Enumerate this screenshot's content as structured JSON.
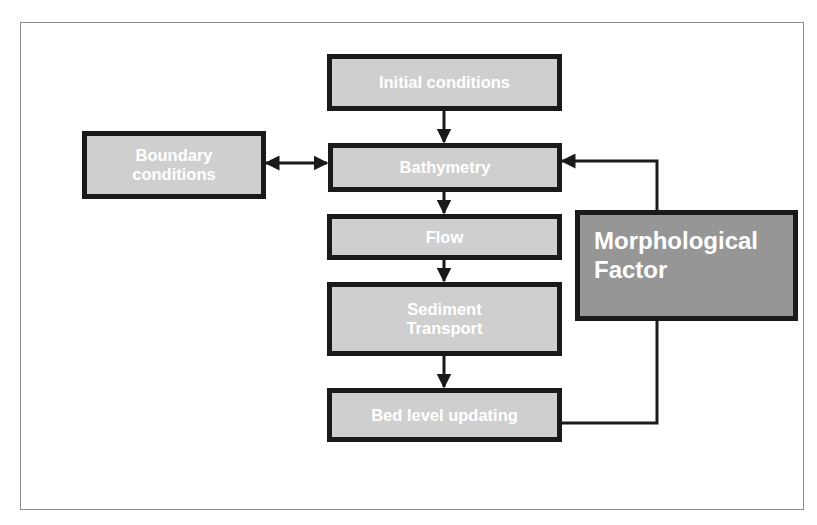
{
  "diagram": {
    "type": "flowchart",
    "colors": {
      "node_fill": "#cfcfcf",
      "highlight_fill": "#969696",
      "border": "#1a1a1a",
      "text": "#ffffff",
      "frame": "#8a8a8a"
    },
    "nodes": {
      "initial_conditions": {
        "label": "Initial conditions"
      },
      "bathymetry": {
        "label": "Bathymetry"
      },
      "flow": {
        "label": "Flow"
      },
      "sediment_transport": {
        "line1": "Sediment",
        "line2": "Transport"
      },
      "bed_level_updating": {
        "label": "Bed level updating"
      },
      "boundary_conditions": {
        "line1": "Boundary",
        "line2": "conditions"
      },
      "morphological_factor": {
        "line1": "Morphological",
        "line2": "Factor"
      }
    },
    "edges": [
      {
        "from": "Initial conditions",
        "to": "Bathymetry",
        "direction": "one-way"
      },
      {
        "from": "Boundary conditions",
        "to": "Bathymetry",
        "direction": "two-way"
      },
      {
        "from": "Bathymetry",
        "to": "Flow",
        "direction": "one-way"
      },
      {
        "from": "Flow",
        "to": "Sediment Transport",
        "direction": "one-way"
      },
      {
        "from": "Sediment Transport",
        "to": "Bed level updating",
        "direction": "one-way"
      },
      {
        "from": "Bed level updating",
        "to": "Morphological Factor",
        "direction": "line"
      },
      {
        "from": "Morphological Factor",
        "to": "Bathymetry",
        "direction": "one-way"
      }
    ]
  }
}
